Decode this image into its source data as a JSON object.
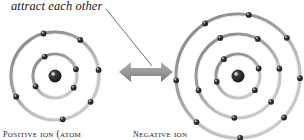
{
  "figure": {
    "annotation": "attract each other",
    "annotation_icon": "leader-line",
    "arrow_icon": "double-headed-arrow",
    "colors": {
      "background": "#ffffff",
      "nucleus": "#2b2b2b",
      "electron": "#262626",
      "orbit_dark": "#8a8a8a",
      "orbit_light": "#cfcfcf",
      "arrow": "#9a9a9a",
      "text": "#1a1a1a",
      "leader": "#55555f"
    }
  },
  "ions": [
    {
      "id": "positive-ion",
      "label": "Positive ion (atom",
      "center": {
        "x": 55,
        "y": 76
      },
      "nucleus_radius": 6.5,
      "shells": [
        {
          "radius": 22,
          "electron_count": 4,
          "electron_angles": [
            -118,
            -18,
            32,
            152
          ]
        },
        {
          "radius": 44,
          "electron_count": 6,
          "electron_angles": [
            -105,
            -55,
            -8,
            36,
            80,
            152
          ]
        }
      ]
    },
    {
      "id": "negative-ion",
      "label": "Negative ion",
      "center": {
        "x": 238,
        "y": 76
      },
      "nucleus_radius": 6.5,
      "shells": [
        {
          "radius": 22,
          "electron_count": 4,
          "electron_angles": [
            -130,
            -20,
            40,
            165
          ]
        },
        {
          "radius": 42,
          "electron_count": 6,
          "electron_angles": [
            -115,
            -62,
            -10,
            38,
            95,
            160
          ]
        },
        {
          "radius": 62,
          "electron_count": 8,
          "electron_angles": [
            -122,
            -80,
            -38,
            2,
            42,
            88,
            132,
            176
          ]
        }
      ]
    }
  ],
  "arrow": {
    "width": 52,
    "height": 26,
    "label": "attraction-arrow"
  },
  "leader_line": {
    "x1": 106,
    "y1": 9,
    "x2": 152,
    "y2": 66
  }
}
